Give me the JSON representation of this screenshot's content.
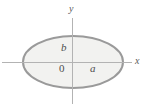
{
  "figure": {
    "name": "ellipse-with-axes",
    "background_color": "#ffffff"
  },
  "axes": {
    "x_label": "x",
    "y_label": "y",
    "origin_label": "0",
    "line_color": "#b3b3b3",
    "x_axis_y": 62,
    "y_axis_x": 72,
    "x_axis_start": 2,
    "x_axis_end": 132,
    "y_axis_start": 18,
    "y_axis_end": 104
  },
  "ellipse": {
    "center_x": 73,
    "center_y": 62,
    "semi_axis_x": 50,
    "semi_axis_y": 26,
    "semi_axis_x_label": "a",
    "semi_axis_y_label": "b",
    "stroke_color": "#9a9a9a",
    "fill_color": "#f2f2f0",
    "stroke_width": 2
  },
  "chart_data": {
    "type": "scatter",
    "title": "",
    "xlabel": "x",
    "ylabel": "y",
    "annotations": [
      "a",
      "b",
      "0"
    ],
    "shapes": [
      {
        "kind": "ellipse",
        "center": [
          0,
          0
        ],
        "semi_axes": [
          "a",
          "b"
        ],
        "filled": true
      }
    ],
    "grid": false,
    "legend": "none"
  }
}
